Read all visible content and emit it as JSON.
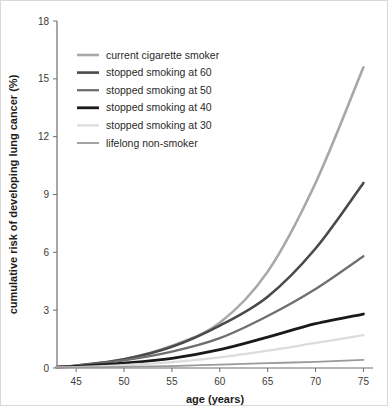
{
  "chart_data": {
    "type": "line",
    "title": "",
    "xlabel": "age (years)",
    "ylabel": "cumulative risk of developing lung cancer (%)",
    "xlim": [
      43,
      76
    ],
    "ylim": [
      0,
      18
    ],
    "xticks": [
      45,
      50,
      55,
      60,
      65,
      70,
      75
    ],
    "yticks": [
      0,
      3,
      6,
      9,
      12,
      15,
      18
    ],
    "grid": false,
    "legend_position": "upper-left",
    "x": [
      43,
      45,
      50,
      55,
      60,
      65,
      70,
      75
    ],
    "series": [
      {
        "name": "current cigarette smoker",
        "color": "#a8a8a8",
        "width": 2.6,
        "values": [
          0.05,
          0.12,
          0.45,
          1.15,
          2.35,
          5.0,
          9.6,
          15.6
        ]
      },
      {
        "name": "stopped smoking at 60",
        "color": "#4a4a4a",
        "width": 2.6,
        "values": [
          0.05,
          0.12,
          0.45,
          1.1,
          2.2,
          3.7,
          6.2,
          9.6
        ]
      },
      {
        "name": "stopped smoking at 50",
        "color": "#6f6f6f",
        "width": 2.3,
        "values": [
          0.05,
          0.12,
          0.4,
          0.85,
          1.55,
          2.7,
          4.1,
          5.8
        ]
      },
      {
        "name": "stopped smoking at 40",
        "color": "#1a1a1a",
        "width": 2.8,
        "values": [
          0.04,
          0.08,
          0.25,
          0.5,
          0.95,
          1.6,
          2.3,
          2.8
        ]
      },
      {
        "name": "stopped smoking at 30",
        "color": "#dcdcdc",
        "width": 2.3,
        "values": [
          0.03,
          0.05,
          0.15,
          0.3,
          0.55,
          0.9,
          1.3,
          1.7
        ]
      },
      {
        "name": "lifelong non-smoker",
        "color": "#9a9a9a",
        "width": 1.8,
        "values": [
          0.02,
          0.03,
          0.06,
          0.1,
          0.18,
          0.25,
          0.32,
          0.42
        ]
      }
    ]
  },
  "legend": {
    "entries": [
      "current cigarette smoker",
      "stopped smoking at 60",
      "stopped smoking at 50",
      "stopped smoking at 40",
      "stopped smoking at 30",
      "lifelong non-smoker"
    ]
  },
  "axes": {
    "x_tick_labels": [
      "45",
      "50",
      "55",
      "60",
      "65",
      "70",
      "75"
    ],
    "y_tick_labels": [
      "0",
      "3",
      "6",
      "9",
      "12",
      "15",
      "18"
    ],
    "x_title": "age (years)",
    "y_title": "cumulative risk of developing lung cancer (%)"
  }
}
